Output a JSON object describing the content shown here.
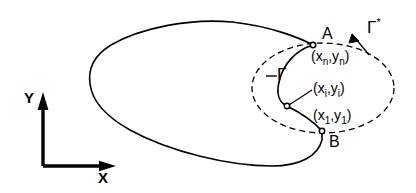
{
  "figure": {
    "kind": "contour-diagram",
    "width": 416,
    "height": 193,
    "background_color": "#ffffff",
    "stroke_color": "#000000",
    "axes": {
      "x_label": "X",
      "y_label": "Y",
      "origin": [
        43,
        166
      ],
      "x_arrow_end": [
        116,
        166
      ],
      "y_arrow_end": [
        43,
        92
      ]
    },
    "labels": {
      "point_a": "A",
      "point_b": "B",
      "coord_n": "(xₙ,yₙ)",
      "coord_i": "(xᵢ,yᵢ)",
      "coord_1": "(x₁,y₁)",
      "gamma": "Γ",
      "gamma_star": "Γ",
      "gamma_star_sup": "*",
      "coord_n_base": "(x",
      "coord_n_sub": "n",
      "coord_n_mid": ",y",
      "coord_n_sub2": "n",
      "coord_n_close": ")",
      "coord_i_base": "(x",
      "coord_i_sub": "i",
      "coord_i_mid": ",y",
      "coord_i_sub2": "i",
      "coord_i_close": ")",
      "coord_1_base": "(x",
      "coord_1_sub": "1",
      "coord_1_mid": ",y",
      "coord_1_sub2": "1",
      "coord_1_close": ")"
    },
    "markers": {
      "point_a_at": [
        313,
        45
      ],
      "point_b_at": [
        322,
        131
      ],
      "point_i_at": [
        287,
        106
      ]
    },
    "curves": {
      "outer_solid": "large closed contour, leftmost x=90, top y=22, bottom y=166, passes through A and B",
      "inner_dashed_ellipse": {
        "center": [
          323,
          88
        ],
        "rx": 71,
        "ry": 45,
        "style": "dashed"
      },
      "inner_solid_arc": "arc from A (313,45) bulging left to x=279 then to B (322,131), passing marker (287,106)"
    }
  }
}
